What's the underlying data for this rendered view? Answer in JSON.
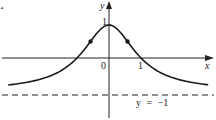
{
  "problem_label": "1.",
  "chart_data": {
    "type": "line",
    "title": "",
    "function_shape": "bell-shaped curve y = 2/(1+x^2) - 1",
    "xlabel": "x",
    "ylabel": "y",
    "x_ticks": [
      "0",
      "1"
    ],
    "y_ticks": [
      "1"
    ],
    "series": [
      {
        "name": "curve",
        "x": [
          -3.2,
          -2.5,
          -2,
          -1.5,
          -1,
          -0.577,
          -0.3,
          0,
          0.3,
          0.577,
          1,
          1.5,
          2,
          2.5,
          3.0
        ],
        "values": [
          -0.82,
          -0.72,
          -0.6,
          -0.385,
          0,
          0.5,
          0.835,
          1,
          0.835,
          0.5,
          0,
          -0.385,
          -0.6,
          -0.72,
          -0.8
        ]
      }
    ],
    "marked_points": [
      {
        "x": -0.577,
        "y": 0.5,
        "note": "inflection point"
      },
      {
        "x": 0.577,
        "y": 0.5,
        "note": "inflection point"
      }
    ],
    "asymptote": {
      "y": -1,
      "label": "y = −1",
      "style": "dashed"
    },
    "annotations": {
      "peak_label": "1",
      "origin_label": "0",
      "x_intercept_label": "1"
    },
    "xlim": [
      -3.4,
      3.3
    ],
    "ylim": [
      -1.8,
      1.7
    ],
    "grid": false,
    "legend": "none"
  },
  "colors": {
    "ink": "#1a1a1a",
    "background": "#ffffff"
  }
}
